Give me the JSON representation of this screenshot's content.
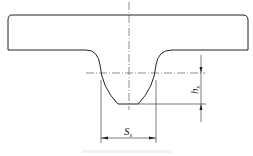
{
  "diagram": {
    "type": "cross-section drawing",
    "labels": {
      "width": {
        "main": "S",
        "sub": "x"
      },
      "height": {
        "main": "h",
        "sub": "x"
      }
    },
    "colors": {
      "line": "#222222",
      "background": "#ffffff"
    }
  }
}
